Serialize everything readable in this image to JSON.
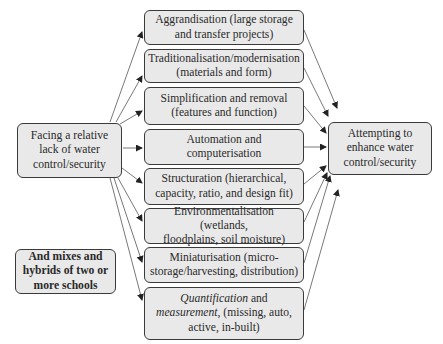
{
  "source_box": {
    "lines": [
      "Facing a relative",
      "lack of water",
      "control/security"
    ]
  },
  "target_box": {
    "lines": [
      "Attempting to",
      "enhance water",
      "control/security"
    ]
  },
  "hybrid_note": {
    "lines": [
      "And mixes and",
      "hybrids of two or",
      "more schools"
    ]
  },
  "schools": [
    {
      "lines": [
        "Aggrandisation (large storage",
        "and transfer projects)"
      ]
    },
    {
      "lines": [
        "Traditionalisation/modernisation",
        "(materials and form)"
      ]
    },
    {
      "lines": [
        "Simplification and removal",
        "(features and function)"
      ]
    },
    {
      "lines": [
        "Automation and",
        "computerisation"
      ]
    },
    {
      "lines": [
        "Structuration (hierarchical,",
        "capacity, ratio, and design fit)"
      ]
    },
    {
      "lines": [
        "Environmentalisation (wetlands,",
        "floodplains, soil moisture)"
      ]
    },
    {
      "lines": [
        "Miniaturisation (micro-",
        "storage/harvesting, distribution)"
      ]
    },
    {
      "italic_1": "Quantification",
      "text_1": " and",
      "italic_2": "measurement",
      "text_2": ", (missing, auto,",
      "line_3": "active, in-built)"
    }
  ],
  "colors": {
    "box_fill": "#e9e9e9",
    "box_border": "#3a3a3a",
    "arrow": "#333333"
  }
}
